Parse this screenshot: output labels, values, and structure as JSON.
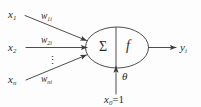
{
  "diagram": {
    "type": "neural-network-neuron",
    "background_color": "#fdfdfd",
    "stroke_color": "#3a3a3a",
    "text_color": "#2b2b2b"
  },
  "inputs": [
    {
      "name": "x1",
      "base": "x",
      "sub": "1",
      "weight_base": "w",
      "weight_sub": "1i"
    },
    {
      "name": "x2",
      "base": "x",
      "sub": "2",
      "weight_base": "w",
      "weight_sub": "2i"
    },
    {
      "name": "xn",
      "base": "x",
      "sub": "n",
      "weight_base": "w",
      "weight_sub": "ni"
    }
  ],
  "ellipsis": {
    "symbol": "⋮",
    "meaning": "vertical-dots-more-inputs"
  },
  "body": {
    "summation_symbol": "Σ",
    "activation_symbol": "f",
    "divider": "vertical-line"
  },
  "bias": {
    "label_base": "x",
    "label_sub": "0",
    "label_value": "=1",
    "threshold_symbol": "θ"
  },
  "output": {
    "base": "y",
    "sub": "i"
  }
}
